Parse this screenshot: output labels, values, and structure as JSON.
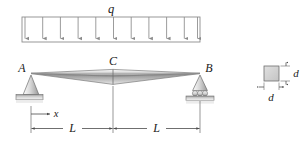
{
  "figure": {
    "background_color": "#ffffff",
    "line_color": "#7b7b7b",
    "text_color": "#1a1a1a"
  },
  "load": {
    "label": "q",
    "arrow_count": 11,
    "box": {
      "x": 22,
      "y": 17,
      "width": 178,
      "height": 25
    },
    "direction": "down"
  },
  "beam": {
    "shape": "lens-taper",
    "left_point_label": "A",
    "center_label": "C",
    "right_point_label": "B",
    "fill_light": "#f2f2f2",
    "fill_dark": "#8e8e8e"
  },
  "supports": {
    "left": {
      "type": "pin",
      "label": "A"
    },
    "right": {
      "type": "roller",
      "label": "B",
      "roller_count": 3
    }
  },
  "axis": {
    "label": "x",
    "direction": "right"
  },
  "dimensions": [
    {
      "label": "L",
      "from": "A",
      "to": "C"
    },
    {
      "label": "L",
      "from": "C",
      "to": "B"
    }
  ],
  "cross_section": {
    "shape": "square",
    "height_label": "d",
    "width_label": "d",
    "fill": "#d2d2d2"
  }
}
